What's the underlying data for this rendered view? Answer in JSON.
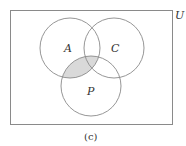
{
  "diagram": {
    "type": "venn",
    "universe_label": "U",
    "sets": [
      {
        "label": "A",
        "cx": 70,
        "cy": 48,
        "r": 30
      },
      {
        "label": "C",
        "cx": 114,
        "cy": 48,
        "r": 30
      },
      {
        "label": "P",
        "cx": 91,
        "cy": 86,
        "r": 30
      }
    ],
    "shaded_region": "A ∩ P",
    "shade_color": "#d9d9d9",
    "stroke_color": "#8a8a8a",
    "caption": "(c)"
  }
}
